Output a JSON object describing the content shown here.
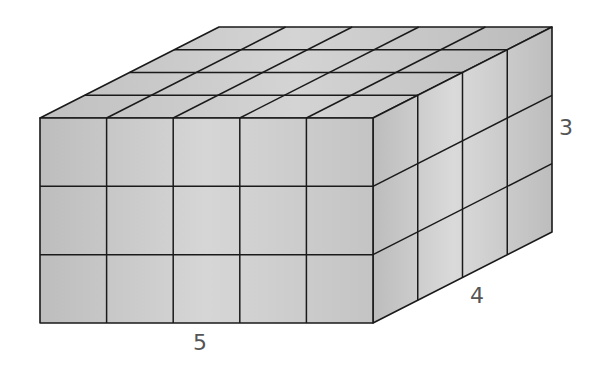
{
  "diagram": {
    "dimensions": {
      "length": 5,
      "depth": 4,
      "height": 3
    },
    "labels": {
      "length": "5",
      "depth": "4",
      "height": "3"
    },
    "colors": {
      "front_face": "#c2c2c2",
      "front_face_light": "#d8d8d8",
      "top_face": "#bdbdbd",
      "top_face_light": "#d4d4d4",
      "side_face": "#b8b8b8",
      "side_face_light": "#dadada",
      "edge": "#1a1a1a",
      "label": "#555555"
    }
  }
}
